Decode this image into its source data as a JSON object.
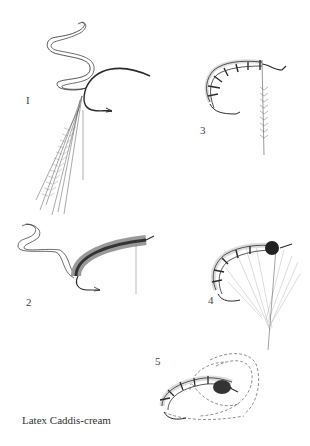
{
  "caption": "Latex Caddis-cream",
  "figures": [
    {
      "id": 1,
      "label": "I",
      "description": "Hook with latex strip tied in and hackle fibers trailing"
    },
    {
      "id": 2,
      "label": "2",
      "description": "Dubbed body wound with latex strip extending"
    },
    {
      "id": 3,
      "label": "3",
      "description": "Segmented latex body with hackle feather tied in"
    },
    {
      "id": 4,
      "label": "4",
      "description": "Segmented body with dark thorax and palmered hackle feather"
    },
    {
      "id": 5,
      "label": "5",
      "description": "Finished fly with legs swept back"
    }
  ],
  "colors": {
    "ink": "#2b2b2b",
    "light_ink": "#888888",
    "background": "#ffffff"
  }
}
